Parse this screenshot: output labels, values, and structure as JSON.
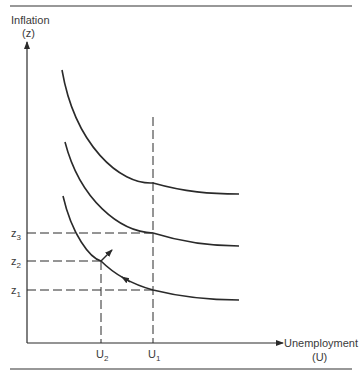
{
  "diagram": {
    "y_axis": {
      "label": "Inflation",
      "symbol": "(z)"
    },
    "x_axis": {
      "label": "Unemployment",
      "symbol": "(U)"
    },
    "y_ticks": [
      {
        "base": "z",
        "sub": "3"
      },
      {
        "base": "z",
        "sub": "2"
      },
      {
        "base": "z",
        "sub": "1"
      }
    ],
    "x_ticks": [
      {
        "base": "U",
        "sub": "2"
      },
      {
        "base": "U",
        "sub": "1"
      }
    ],
    "curves": [
      "upper-phillips-curve",
      "middle-phillips-curve",
      "lower-phillips-curve"
    ],
    "arrows": [
      "movement-along-lower-curve-toward-U2",
      "shift-up-arrow-at-z2"
    ],
    "colors": {
      "ink": "#2a2a2a",
      "background": "#ffffff"
    }
  }
}
